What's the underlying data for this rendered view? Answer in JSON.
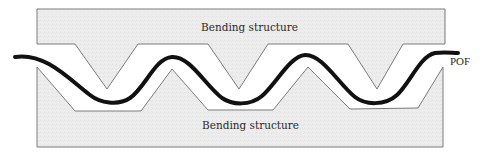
{
  "diagram": {
    "title": "",
    "labels": {
      "top_structure": "Bending structure",
      "bottom_structure": "Bending structure",
      "fiber": "POF"
    },
    "colors": {
      "structure_fill": "#ececec",
      "structure_stroke": "#7a7a7a",
      "fiber": "#111111",
      "background": "#ffffff",
      "text": "#2a2a2a"
    },
    "elements": [
      {
        "id": "top-bending-structure",
        "type": "block-with-v-teeth",
        "teeth": 3
      },
      {
        "id": "bottom-bending-structure",
        "type": "block-with-v-teeth",
        "teeth": 3
      },
      {
        "id": "pof",
        "type": "wavy-fiber",
        "troughs": 3,
        "peaks": 2
      }
    ]
  }
}
